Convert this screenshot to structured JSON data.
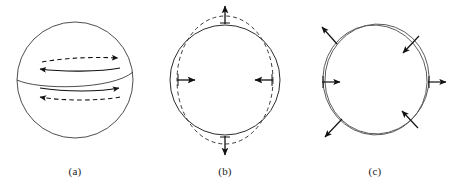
{
  "figure": {
    "background_color": "#ffffff",
    "line_color": "#3a3a3a",
    "arrow_color": "#111111",
    "panel_count": 3
  },
  "panels": [
    {
      "id": "a",
      "caption": "(a)",
      "shape": "sphere-with-equator",
      "description": "Sphere with curved equator line and four horizontal zonal-flow arrows",
      "arrows": [
        {
          "name": "upper-dashed-right",
          "style": "dashed",
          "direction": "right"
        },
        {
          "name": "upper-solid-left",
          "style": "solid",
          "direction": "left"
        },
        {
          "name": "lower-solid-right",
          "style": "solid",
          "direction": "right"
        },
        {
          "name": "lower-dashed-left",
          "style": "dashed",
          "direction": "left"
        }
      ]
    },
    {
      "id": "b",
      "caption": "(b)",
      "shape": "circle-with-dashed-prolate-ellipse",
      "description": "Solid circle overlaid by a dashed vertically-elongated ellipse; quadrupole deformation",
      "arrows": [
        {
          "name": "top-outward",
          "style": "solid",
          "direction": "up"
        },
        {
          "name": "bottom-outward",
          "style": "solid",
          "direction": "down"
        },
        {
          "name": "left-inward",
          "style": "solid",
          "direction": "right"
        },
        {
          "name": "right-inward",
          "style": "solid",
          "direction": "left"
        }
      ]
    },
    {
      "id": "c",
      "caption": "(c)",
      "shape": "two-offset-rotated-circles",
      "description": "Two nearly identical circles slightly rotated/offset from one another with tangential displacement arrows",
      "arrows": [
        {
          "name": "upper-left-outward",
          "style": "solid",
          "direction": "up-left"
        },
        {
          "name": "upper-right-inward",
          "style": "solid",
          "direction": "down-left"
        },
        {
          "name": "left-rightward",
          "style": "solid",
          "direction": "right"
        },
        {
          "name": "right-rightward",
          "style": "solid",
          "direction": "right"
        },
        {
          "name": "lower-right-inward",
          "style": "solid",
          "direction": "up-left"
        },
        {
          "name": "lower-left-outward",
          "style": "solid",
          "direction": "down-left"
        }
      ]
    }
  ]
}
